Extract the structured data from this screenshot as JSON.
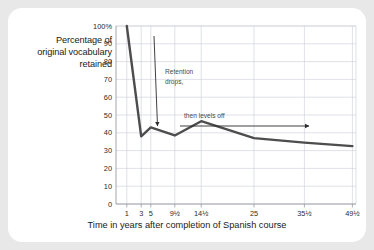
{
  "card": {
    "background": "#ffffff",
    "page_background": "#e8e8e8"
  },
  "axis": {
    "ylabel_line1": "Percentage of",
    "ylabel_line2": "original vocabulary",
    "ylabel_line3": "retained",
    "xlabel": "Time in years after completion of Spanish course"
  },
  "annotations": [
    {
      "id": "retention-drops",
      "line1": "Retention",
      "line2": "drops,"
    },
    {
      "id": "levels-off",
      "line1": "then levels off"
    }
  ],
  "colors": {
    "line": "#4d4d4d",
    "grid": "#c9ccd6",
    "axis": "#8e9199",
    "text": "#1a1a1a",
    "annotation": "#4a4a4a"
  },
  "chart_data": {
    "type": "line",
    "title": "",
    "xlabel": "Time in years after completion of Spanish course",
    "ylabel": "Percentage of original vocabulary retained",
    "ylim": [
      0,
      100
    ],
    "yticks": [
      0,
      10,
      20,
      30,
      40,
      50,
      60,
      70,
      80,
      90,
      100
    ],
    "ytick_labels": [
      "0",
      "10",
      "20",
      "30",
      "40",
      "50",
      "60",
      "70",
      "80",
      "90",
      "100%"
    ],
    "xtick_labels": [
      "1",
      "3",
      "5",
      "9½",
      "14½",
      "25",
      "35½",
      "49½"
    ],
    "x": [
      1,
      3,
      5,
      9.5,
      14.5,
      25,
      35.5,
      49.5
    ],
    "values": [
      100,
      38,
      43,
      38.5,
      46.5,
      37,
      34.5,
      32.5
    ],
    "series": [
      {
        "name": "Percentage of original vocabulary retained",
        "values": [
          100,
          38,
          43,
          38.5,
          46.5,
          37,
          34.5,
          32.5
        ]
      }
    ],
    "grid": true,
    "legend": "none"
  }
}
